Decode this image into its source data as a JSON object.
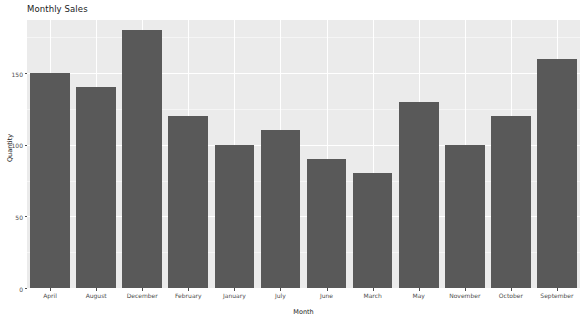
{
  "chart_data": {
    "type": "bar",
    "title": "Monthly Sales",
    "xlabel": "Month",
    "ylabel": "Quantity",
    "categories": [
      "April",
      "August",
      "December",
      "February",
      "January",
      "July",
      "June",
      "March",
      "May",
      "November",
      "October",
      "September"
    ],
    "values": [
      150,
      140,
      180,
      120,
      100,
      110,
      90,
      80,
      130,
      100,
      120,
      160
    ],
    "ylim": [
      0,
      187
    ],
    "yticks": [
      0,
      50,
      100,
      150
    ],
    "ytick_labels": [
      "0",
      "50",
      "100",
      "150"
    ],
    "grid": true,
    "legend": false,
    "bar_color": "#595959",
    "panel_color": "#ebebeb",
    "gridline_color": "#ffffff",
    "axis_text_color": "#4d4d4d"
  }
}
